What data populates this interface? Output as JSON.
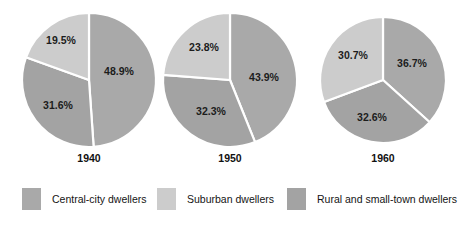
{
  "chart_data": {
    "type": "pie",
    "title": "",
    "subtitle": "",
    "xlabel": "",
    "ylabel": "",
    "grid": false,
    "legend_position": "bottom",
    "units": "percent",
    "categories": [
      "Central-city dwellers",
      "Suburban dwellers",
      "Rural and small-town dwellers"
    ],
    "colors": [
      "#a9a9a9",
      "#cccccc",
      "#a3a3a3"
    ],
    "separator_color": "#ffffff",
    "charts": [
      {
        "label": "1940",
        "slices": [
          {
            "category": "Central-city dwellers",
            "value": 48.9,
            "label": "48.9%"
          },
          {
            "category": "Rural and small-town dwellers",
            "value": 31.6,
            "label": "31.6%"
          },
          {
            "category": "Suburban dwellers",
            "value": 19.5,
            "label": "19.5%"
          }
        ]
      },
      {
        "label": "1950",
        "slices": [
          {
            "category": "Central-city dwellers",
            "value": 43.9,
            "label": "43.9%"
          },
          {
            "category": "Rural and small-town dwellers",
            "value": 32.3,
            "label": "32.3%"
          },
          {
            "category": "Suburban dwellers",
            "value": 23.8,
            "label": "23.8%"
          }
        ]
      },
      {
        "label": "1960",
        "slices": [
          {
            "category": "Central-city dwellers",
            "value": 36.7,
            "label": "36.7%"
          },
          {
            "category": "Rural and small-town dwellers",
            "value": 32.6,
            "label": "32.6%"
          },
          {
            "category": "Suburban dwellers",
            "value": 30.7,
            "label": "30.7%"
          }
        ]
      }
    ]
  },
  "pies": [
    {
      "year": "1940",
      "center_x": 89,
      "center_y": 80,
      "radius": 67,
      "year_x": 89,
      "year_y": 152,
      "slices": [
        {
          "pct": "48.9%",
          "value": 48.9,
          "color": "#a9a9a9",
          "label_x": 119,
          "label_y": 72,
          "name": "central-city"
        },
        {
          "pct": "31.6%",
          "value": 31.6,
          "color": "#a3a3a3",
          "label_x": 58,
          "label_y": 106,
          "name": "rural-small-town"
        },
        {
          "pct": "19.5%",
          "value": 19.5,
          "color": "#cccccc",
          "label_x": 61,
          "label_y": 41,
          "name": "suburban"
        }
      ]
    },
    {
      "year": "1950",
      "center_x": 230,
      "center_y": 80,
      "radius": 67,
      "year_x": 230,
      "year_y": 152,
      "slices": [
        {
          "pct": "43.9%",
          "value": 43.9,
          "color": "#a9a9a9",
          "label_x": 264,
          "label_y": 78,
          "name": "central-city"
        },
        {
          "pct": "32.3%",
          "value": 32.3,
          "color": "#a3a3a3",
          "label_x": 211,
          "label_y": 112,
          "name": "rural-small-town"
        },
        {
          "pct": "23.8%",
          "value": 23.8,
          "color": "#cccccc",
          "label_x": 204,
          "label_y": 48,
          "name": "suburban"
        }
      ]
    },
    {
      "year": "1960",
      "center_x": 383,
      "center_y": 80,
      "radius": 63,
      "year_x": 383,
      "year_y": 152,
      "slices": [
        {
          "pct": "36.7%",
          "value": 36.7,
          "color": "#a9a9a9",
          "label_x": 412,
          "label_y": 64,
          "name": "central-city"
        },
        {
          "pct": "32.6%",
          "value": 32.6,
          "color": "#a3a3a3",
          "label_x": 372,
          "label_y": 118,
          "name": "rural-small-town"
        },
        {
          "pct": "30.7%",
          "value": 30.7,
          "color": "#cccccc",
          "label_x": 353,
          "label_y": 56,
          "name": "suburban"
        }
      ]
    }
  ],
  "legend": {
    "items": [
      {
        "label": "Central-city dwellers",
        "color": "#a9a9a9",
        "x": 22,
        "name": "central-city"
      },
      {
        "label": "Suburban dwellers",
        "color": "#cccccc",
        "x": 157,
        "name": "suburban"
      },
      {
        "label": "Rural and small-town dwellers",
        "color": "#a3a3a3",
        "x": 287,
        "name": "rural-small-town"
      }
    ]
  }
}
